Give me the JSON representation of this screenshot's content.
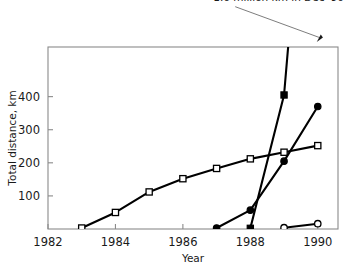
{
  "chart_data": {
    "type": "line",
    "title": "",
    "xlabel": "Year",
    "ylabel": "Total distance, km",
    "xlim": [
      1982,
      1990.6
    ],
    "ylim": [
      0,
      550
    ],
    "grid": false,
    "legend": "none",
    "x_ticks": [
      "1982",
      "1984",
      "1986",
      "1988",
      "1990"
    ],
    "x_tick_values": [
      1982,
      1984,
      1986,
      1988,
      1990
    ],
    "y_ticks": [
      "100",
      "200",
      "300",
      "400"
    ],
    "y_tick_values": [
      100,
      200,
      300,
      400
    ],
    "annotations": [
      {
        "text": "1.6 million km in Dec '90",
        "points_to_x": 1990.0,
        "points_to_y": 550,
        "label_x": 1986.9,
        "label_y": 690
      }
    ],
    "series": [
      {
        "name": "open-square-series",
        "marker": "open-square",
        "x": [
          1983,
          1984,
          1985,
          1986,
          1987,
          1988,
          1989,
          1990
        ],
        "values": [
          3,
          50,
          112,
          152,
          183,
          212,
          232,
          252
        ]
      },
      {
        "name": "filled-square-series",
        "marker": "filled-square",
        "x": [
          1988,
          1989,
          1990
        ],
        "values": [
          2,
          405,
          1600
        ]
      },
      {
        "name": "filled-circle-series",
        "marker": "filled-circle",
        "x": [
          1987,
          1988,
          1989,
          1990
        ],
        "values": [
          3,
          57,
          205,
          370
        ]
      },
      {
        "name": "open-circle-series",
        "marker": "open-circle",
        "x": [
          1989,
          1990
        ],
        "values": [
          4,
          16
        ]
      }
    ]
  }
}
